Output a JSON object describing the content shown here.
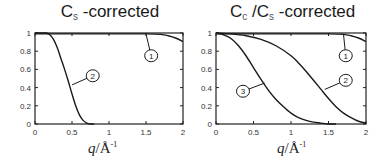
{
  "chart_data": [
    {
      "type": "line",
      "title": "Cs -corrected",
      "title_main": "C",
      "title_sub": "s",
      "title_rest": " -corrected",
      "xlabel": "q/Å⁻¹",
      "ylabel": "",
      "xlim": [
        0,
        2
      ],
      "ylim": [
        0,
        1
      ],
      "xticks": [
        "0",
        "0.5",
        "1",
        "1.5",
        "2"
      ],
      "yticks": [
        "0",
        "0.2",
        "0.4",
        "0.6",
        "0.8",
        "1"
      ],
      "grid": false,
      "legend": "callout circles",
      "series": [
        {
          "name": "1",
          "x": [
            0,
            0.5,
            1.0,
            1.5,
            1.7,
            1.8,
            1.9,
            2.0
          ],
          "y": [
            0.99,
            0.99,
            0.99,
            0.99,
            0.985,
            0.97,
            0.945,
            0.905
          ],
          "label_pos": [
            1.57,
            0.75
          ],
          "anchor": [
            1.5,
            0.99
          ]
        },
        {
          "name": "2",
          "x": [
            0,
            0.15,
            0.2,
            0.25,
            0.3,
            0.35,
            0.4,
            0.45,
            0.5,
            0.55,
            0.6,
            0.65,
            0.7,
            0.75,
            0.8
          ],
          "y": [
            1.0,
            1.0,
            0.98,
            0.93,
            0.84,
            0.72,
            0.6,
            0.47,
            0.33,
            0.2,
            0.1,
            0.04,
            0.01,
            0.0,
            0.0
          ],
          "label_pos": [
            0.78,
            0.53
          ],
          "anchor": [
            0.5,
            0.43
          ]
        }
      ]
    },
    {
      "type": "line",
      "title": "Cc /Cs -corrected",
      "title_main": "C",
      "title_sub": "c",
      "title_mid": " /C",
      "title_sub2": "s",
      "title_rest": " -corrected",
      "xlabel": "q/Å⁻¹",
      "ylabel": "",
      "xlim": [
        0,
        2
      ],
      "ylim": [
        0,
        1
      ],
      "xticks": [
        "0",
        "0.5",
        "1",
        "1.5",
        "2"
      ],
      "yticks": [
        "0",
        "0.2",
        "0.4",
        "0.6",
        "0.8",
        "1"
      ],
      "grid": false,
      "legend": "callout circles",
      "series": [
        {
          "name": "1",
          "x": [
            0,
            0.5,
            1.0,
            1.5,
            1.7,
            1.8,
            1.9,
            2.0
          ],
          "y": [
            0.99,
            0.99,
            0.99,
            0.99,
            0.985,
            0.97,
            0.945,
            0.905
          ],
          "label_pos": [
            1.73,
            0.75
          ],
          "anchor": [
            1.7,
            0.985
          ]
        },
        {
          "name": "2",
          "x": [
            0,
            0.2,
            0.4,
            0.6,
            0.8,
            1.0,
            1.1,
            1.2,
            1.3,
            1.4,
            1.5,
            1.6,
            1.7,
            1.8,
            1.9,
            2.0
          ],
          "y": [
            1.0,
            0.99,
            0.97,
            0.93,
            0.86,
            0.75,
            0.67,
            0.58,
            0.48,
            0.38,
            0.28,
            0.19,
            0.12,
            0.07,
            0.03,
            0.01
          ],
          "label_pos": [
            1.73,
            0.48
          ],
          "anchor": [
            1.45,
            0.38
          ]
        },
        {
          "name": "3",
          "x": [
            0,
            0.1,
            0.2,
            0.3,
            0.4,
            0.5,
            0.6,
            0.7,
            0.8,
            0.9,
            1.0,
            1.1,
            1.2,
            1.3,
            1.4,
            1.5,
            1.6
          ],
          "y": [
            1.0,
            0.98,
            0.94,
            0.86,
            0.75,
            0.62,
            0.49,
            0.37,
            0.27,
            0.19,
            0.12,
            0.07,
            0.04,
            0.02,
            0.01,
            0.0,
            0.0
          ],
          "label_pos": [
            0.36,
            0.36
          ],
          "anchor": [
            0.65,
            0.45
          ]
        }
      ]
    }
  ],
  "panels": [
    {
      "title_main": "C",
      "title_sub": "s",
      "title_rest": " -corrected",
      "xlabel_q": "q",
      "xlabel_rest": "/Å",
      "xlabel_sup": "-1"
    },
    {
      "title_main": "C",
      "title_sub": "c",
      "title_mid": " /C",
      "title_sub2": "s",
      "title_rest": " -corrected",
      "xlabel_q": "q",
      "xlabel_rest": "/Å",
      "xlabel_sup": "-1"
    }
  ]
}
